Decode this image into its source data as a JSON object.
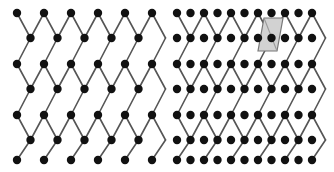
{
  "figure": {
    "width": 334,
    "height": 172,
    "background_color": "#ffffff",
    "panel_count": 2
  },
  "style": {
    "edge_color": "#555555",
    "edge_width": 1.6,
    "node_color": "#111111",
    "node_radius": 4.2,
    "highlight_fill": "#d2d2d2",
    "highlight_stroke": "#777777",
    "highlight_diagonal_color": "#9a9a9a"
  },
  "panels": [
    {
      "id": "left",
      "name": "plain-diamond-lattice",
      "label": "",
      "origin_x": 17,
      "origin_y": 13,
      "col_spacing": 27,
      "row_spacing": 25.5,
      "cols": 6,
      "rows": 7,
      "site_rule": "checkerboard",
      "extra_sites": false,
      "highlight": null,
      "node_rows": [
        {
          "y": 13,
          "xs": [
            17,
            44,
            71,
            98,
            125,
            152
          ]
        },
        {
          "y": 38,
          "xs": [
            30.5,
            57.5,
            84.5,
            111.5,
            138.5
          ]
        },
        {
          "y": 64,
          "xs": [
            17,
            44,
            71,
            98,
            125,
            152
          ]
        },
        {
          "y": 89,
          "xs": [
            30.5,
            57.5,
            84.5,
            111.5,
            138.5
          ]
        },
        {
          "y": 115,
          "xs": [
            17,
            44,
            71,
            98,
            125,
            152
          ]
        },
        {
          "y": 140,
          "xs": [
            30.5,
            57.5,
            84.5,
            111.5,
            138.5
          ]
        },
        {
          "y": 160,
          "xs": [
            17,
            44,
            71,
            98,
            125,
            152
          ]
        }
      ]
    },
    {
      "id": "right",
      "name": "decorated-diamond-lattice",
      "label": "",
      "origin_x": 10,
      "origin_y": 13,
      "col_spacing": 13.5,
      "row_spacing": 25.5,
      "cols": 11,
      "rows": 7,
      "site_rule": "full-grid",
      "extra_sites": true,
      "highlight": {
        "name": "unit-cell-highlight",
        "shape": "parallelogram",
        "fill": "#d2d2d2",
        "stroke": "#777777",
        "points": "97,18 116,18 110,51 91,51",
        "diagonal": "97,18 110,51"
      },
      "node_rows": [
        {
          "y": 13,
          "xs": [
            10,
            23.5,
            37,
            50.5,
            64,
            77.5,
            91,
            104.5,
            118,
            131.5,
            145
          ]
        },
        {
          "y": 38,
          "xs": [
            10,
            23.5,
            37,
            50.5,
            64,
            77.5,
            91,
            104.5,
            118,
            131.5,
            145
          ]
        },
        {
          "y": 64,
          "xs": [
            10,
            23.5,
            37,
            50.5,
            64,
            77.5,
            91,
            104.5,
            118,
            131.5,
            145
          ]
        },
        {
          "y": 89,
          "xs": [
            10,
            23.5,
            37,
            50.5,
            64,
            77.5,
            91,
            104.5,
            118,
            131.5,
            145
          ]
        },
        {
          "y": 115,
          "xs": [
            10,
            23.5,
            37,
            50.5,
            64,
            77.5,
            91,
            104.5,
            118,
            131.5,
            145
          ]
        },
        {
          "y": 140,
          "xs": [
            10,
            23.5,
            37,
            50.5,
            64,
            77.5,
            91,
            104.5,
            118,
            131.5,
            145
          ]
        },
        {
          "y": 160,
          "xs": [
            10,
            23.5,
            37,
            50.5,
            64,
            77.5,
            91,
            104.5,
            118,
            131.5,
            145
          ]
        }
      ]
    }
  ],
  "chart_data": {
    "type": "scatter",
    "title": "",
    "xlabel": "",
    "ylabel": "",
    "series": [
      {
        "name": "left-lattice-nodes",
        "x": [
          17,
          44,
          71,
          98,
          125,
          152,
          30.5,
          57.5,
          84.5,
          111.5,
          138.5,
          17,
          44,
          71,
          98,
          125,
          152,
          30.5,
          57.5,
          84.5,
          111.5,
          138.5,
          17,
          44,
          71,
          98,
          125,
          152,
          30.5,
          57.5,
          84.5,
          111.5,
          138.5,
          17,
          44,
          71,
          98,
          125,
          152
        ],
        "y": [
          13,
          13,
          13,
          13,
          13,
          13,
          38,
          38,
          38,
          38,
          38,
          64,
          64,
          64,
          64,
          64,
          64,
          89,
          89,
          89,
          89,
          89,
          115,
          115,
          115,
          115,
          115,
          115,
          140,
          140,
          140,
          140,
          140,
          160,
          160,
          160,
          160,
          160,
          160
        ]
      },
      {
        "name": "right-lattice-nodes",
        "count": 77,
        "note": "11 columns x 7 rows full rectangular grid of dots"
      }
    ],
    "grid": false,
    "legend": "none"
  }
}
